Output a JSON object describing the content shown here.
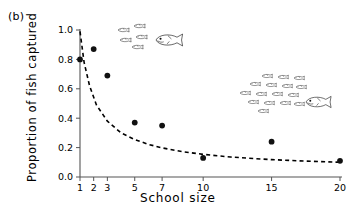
{
  "panel": {
    "label": "(b)"
  },
  "chart_data": {
    "type": "scatter",
    "title": "",
    "xlabel": "School size",
    "ylabel": "Proportion of fish captured",
    "x": [
      1,
      2,
      3,
      5,
      7,
      10,
      15,
      20
    ],
    "values": [
      0.8,
      0.87,
      0.69,
      0.37,
      0.35,
      0.13,
      0.24,
      0.11
    ],
    "xticks": [
      "1",
      "2",
      "3",
      "5",
      "7",
      "10",
      "15",
      "20"
    ],
    "xtick_values": [
      1,
      2,
      3,
      5,
      7,
      10,
      15,
      20
    ],
    "yticks": [
      "0.0",
      "0.2",
      "0.4",
      "0.6",
      "0.8",
      "1.0"
    ],
    "ytick_values": [
      0.0,
      0.2,
      0.4,
      0.6,
      0.8,
      1.0
    ],
    "xlim": [
      1,
      20
    ],
    "ylim": [
      0.0,
      1.0
    ],
    "grid": false,
    "legend": null,
    "fit_curve": {
      "style": "dashed",
      "description": "decaying power-law fit through points",
      "points_x": [
        1,
        1.3,
        1.7,
        2.2,
        3,
        4,
        5,
        6,
        7,
        8.5,
        10,
        12,
        15,
        17.5,
        20
      ],
      "points_y": [
        0.99,
        0.78,
        0.62,
        0.49,
        0.38,
        0.3,
        0.255,
        0.222,
        0.198,
        0.172,
        0.154,
        0.136,
        0.118,
        0.108,
        0.1
      ]
    },
    "annotations": [
      {
        "name": "small-school-illustration",
        "x_data": 4.2,
        "y_data": 0.92,
        "fish_count": 5,
        "predator": true
      },
      {
        "name": "large-school-illustration",
        "x_data": 14.0,
        "y_data": 0.6,
        "fish_count": 16,
        "predator": true
      }
    ]
  },
  "colors": {
    "point": "#111111",
    "curve": "#000000",
    "axis": "#555555",
    "background": "#ffffff"
  }
}
